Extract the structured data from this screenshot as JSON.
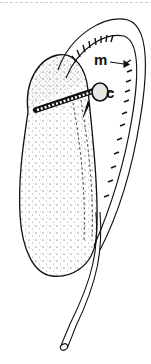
{
  "figure": {
    "type": "line-drawing",
    "labels": [
      {
        "id": "m",
        "text": "m",
        "pointer": "arrow"
      },
      {
        "id": "c",
        "text": "c",
        "pointer": "line"
      }
    ],
    "colors": {
      "ink": "#111111",
      "background": "#ffffff"
    }
  }
}
